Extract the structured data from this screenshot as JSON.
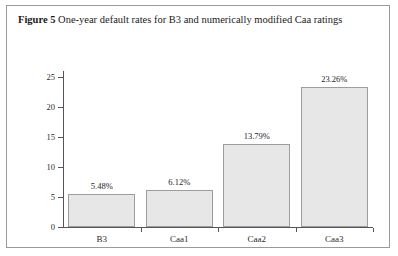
{
  "figure": {
    "label": "Figure 5",
    "caption": "One-year default rates for B3 and numerically modified Caa ratings"
  },
  "chart_data": {
    "type": "bar",
    "title": "One-year default rates for B3 and numerically modified Caa ratings",
    "categories": [
      "B3",
      "Caa1",
      "Caa2",
      "Caa3"
    ],
    "values": [
      5.48,
      6.12,
      13.79,
      23.26
    ],
    "data_labels": [
      "5.48%",
      "6.12%",
      "13.79%",
      "23.26%"
    ],
    "xlabel": "",
    "ylabel": "",
    "ylim": [
      0,
      25
    ],
    "yticks": [
      0,
      5,
      10,
      15,
      20,
      25
    ],
    "ytick_labels": [
      "0",
      "5",
      "10",
      "15",
      "20",
      "25"
    ],
    "grid": false,
    "legend": false,
    "bar_fill_color": "#e7e7e7",
    "bar_border_color": "#9d9d9d",
    "axis_color": "#55545a",
    "background_color": "#ffffff"
  }
}
